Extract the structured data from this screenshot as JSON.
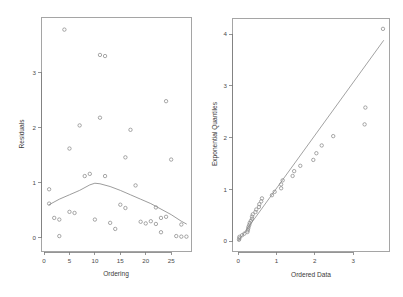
{
  "figure": {
    "title": "",
    "background_color": "#ffffff",
    "point_color": "#8a8a8a",
    "line_color": "#8a8a8a",
    "axis_color": "#7a7a7a"
  },
  "chart_data": [
    {
      "type": "scatter",
      "panel": "left",
      "title": "",
      "xlabel": "Ordering",
      "ylabel": "Residuals",
      "xlim": [
        -0.5,
        29.0
      ],
      "ylim": [
        -0.25,
        4.0
      ],
      "xticks": [
        0,
        5,
        10,
        15,
        20,
        25
      ],
      "xtick_labels": [
        "0",
        "5",
        "10",
        "15",
        "20",
        "25"
      ],
      "yticks": [
        0,
        1,
        2,
        3
      ],
      "ytick_labels": [
        "0",
        "1",
        "2",
        "3"
      ],
      "grid": false,
      "legend": false,
      "marker": "open-circle",
      "x": [
        1,
        1,
        2,
        3,
        3,
        4,
        5,
        5,
        6,
        7,
        8,
        9,
        10,
        11,
        11,
        12,
        12,
        13,
        14,
        15,
        16,
        16,
        17,
        18,
        19,
        20,
        21,
        22,
        22,
        23,
        23,
        24,
        24,
        25,
        26,
        27,
        27,
        28
      ],
      "y": [
        0.62,
        0.88,
        0.36,
        0.03,
        0.33,
        3.78,
        1.62,
        0.47,
        0.45,
        2.04,
        1.12,
        1.16,
        0.33,
        2.18,
        3.32,
        3.3,
        1.12,
        0.27,
        0.16,
        0.6,
        1.46,
        0.54,
        1.96,
        0.95,
        0.29,
        0.26,
        0.3,
        0.25,
        0.55,
        0.1,
        0.36,
        2.48,
        0.38,
        1.42,
        0.03,
        0.02,
        0.24,
        0.02
      ],
      "smoother": {
        "name": "lowess",
        "x": [
          1,
          3,
          5,
          7,
          9,
          10,
          11,
          13,
          15,
          17,
          19,
          21,
          23,
          25,
          27,
          28
        ],
        "y": [
          0.6,
          0.7,
          0.78,
          0.86,
          0.96,
          0.99,
          0.98,
          0.93,
          0.86,
          0.78,
          0.7,
          0.62,
          0.52,
          0.42,
          0.3,
          0.25
        ]
      }
    },
    {
      "type": "scatter",
      "panel": "right",
      "title": "",
      "xlabel": "Ordered Data",
      "ylabel": "Exponential Quantiles",
      "xlim": [
        -0.15,
        3.95
      ],
      "ylim": [
        -0.2,
        4.3
      ],
      "xticks": [
        0,
        1,
        2,
        3
      ],
      "xtick_labels": [
        "0",
        "1",
        "2",
        "3"
      ],
      "yticks": [
        0,
        1,
        2,
        3,
        4
      ],
      "ytick_labels": [
        "0",
        "1",
        "2",
        "3",
        "4"
      ],
      "grid": false,
      "legend": false,
      "marker": "open-circle",
      "x": [
        0.02,
        0.03,
        0.03,
        0.1,
        0.16,
        0.24,
        0.25,
        0.26,
        0.27,
        0.29,
        0.3,
        0.33,
        0.36,
        0.36,
        0.38,
        0.45,
        0.47,
        0.54,
        0.55,
        0.6,
        0.62,
        0.88,
        0.95,
        1.12,
        1.12,
        1.16,
        1.42,
        1.46,
        1.62,
        1.96,
        2.04,
        2.18,
        2.48,
        3.3,
        3.32,
        3.78
      ],
      "y": [
        0.027,
        0.055,
        0.084,
        0.114,
        0.145,
        0.177,
        0.21,
        0.244,
        0.279,
        0.315,
        0.353,
        0.392,
        0.432,
        0.474,
        0.518,
        0.563,
        0.611,
        0.661,
        0.713,
        0.768,
        0.826,
        0.887,
        0.952,
        1.021,
        1.095,
        1.174,
        1.259,
        1.352,
        1.455,
        1.569,
        1.698,
        1.848,
        2.028,
        2.255,
        2.58,
        4.1
      ],
      "reference_line": {
        "type": "line-through-origin",
        "x": [
          0.0,
          3.8
        ],
        "y": [
          0.0,
          3.88
        ]
      }
    }
  ]
}
